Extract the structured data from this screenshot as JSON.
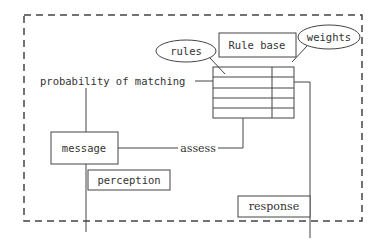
{
  "diagram": {
    "boundary": {
      "style": "dashed"
    },
    "nodes": {
      "rule_base": "Rule base",
      "rules": "rules",
      "weights": "weights",
      "probability": "probability of matching",
      "message": "message",
      "assess": "assess",
      "perception": "perception",
      "response": "response"
    },
    "table": {
      "rows": 5,
      "columns": 2
    },
    "colors": {
      "stroke": "#444444",
      "text": "#333333",
      "background": "#ffffff"
    }
  }
}
